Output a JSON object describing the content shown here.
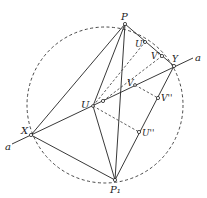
{
  "diagram": {
    "type": "geometric-construction",
    "colors": {
      "ink": "#222222",
      "background": "#ffffff"
    },
    "circle": {
      "cx": 105,
      "cy": 105,
      "r": 78,
      "style": "dashed"
    },
    "points": {
      "P": {
        "label": "P",
        "x": 125,
        "y": 24,
        "lx": 121,
        "ly": 20
      },
      "P1": {
        "label": "P₁",
        "x": 115,
        "y": 180,
        "lx": 110,
        "ly": 193
      },
      "X": {
        "label": "X",
        "x": 31,
        "y": 135,
        "lx": 22,
        "ly": 133
      },
      "Y": {
        "label": "Y",
        "x": 174,
        "y": 66,
        "lx": 173,
        "ly": 60
      },
      "U": {
        "label": "U",
        "x": 93,
        "y": 106,
        "lx": 82,
        "ly": 104
      },
      "V": {
        "label": "V",
        "x": 135,
        "y": 85,
        "lx": 127,
        "ly": 83
      },
      "U1": {
        "label": "U'",
        "x": 145,
        "y": 42,
        "lx": 135,
        "ly": 47
      },
      "V1": {
        "label": "V'",
        "x": 162,
        "y": 56,
        "lx": 152,
        "ly": 59
      },
      "V2": {
        "label": "V''",
        "x": 158,
        "y": 98,
        "lx": 161,
        "ly": 102
      },
      "U2": {
        "label": "U''",
        "x": 139,
        "y": 132,
        "lx": 142,
        "ly": 136
      },
      "W": {
        "label": "",
        "x": 103,
        "y": 101
      }
    },
    "line_a": {
      "label_left": "a",
      "label_right": "a",
      "x1": 8,
      "y1": 146,
      "x2": 193,
      "y2": 58
    }
  }
}
